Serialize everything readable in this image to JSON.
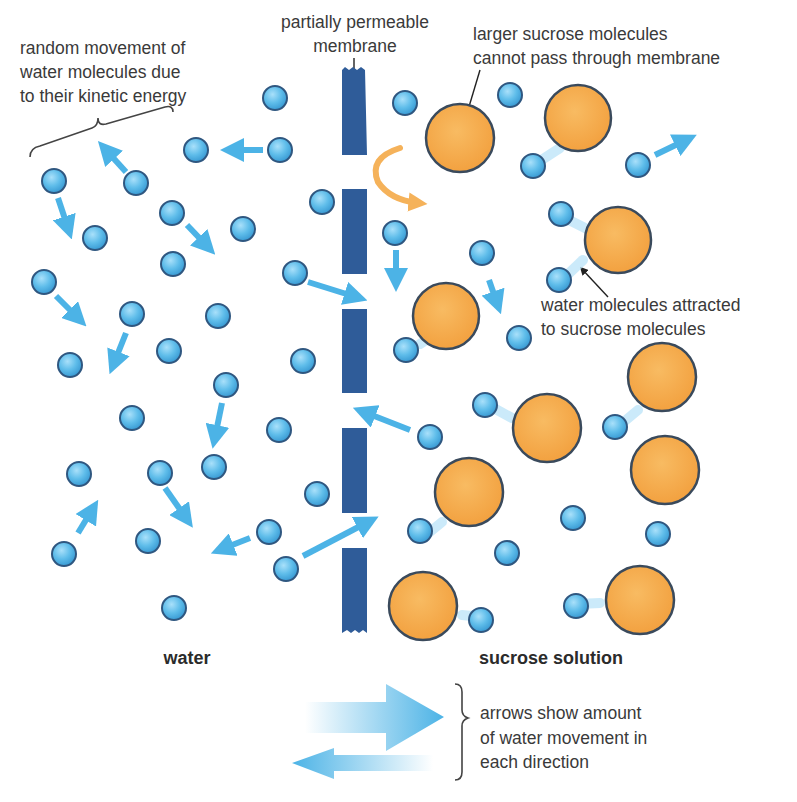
{
  "diagram": {
    "colors": {
      "water_molecule": "#5fbdea",
      "water_outline": "#2f5780",
      "sucrose_molecule": "#f5a94a",
      "sucrose_outline": "#3a4a5c",
      "membrane": "#2f5c99",
      "movement_arrow": "#4cb3e6",
      "blocked_arrow": "#f5b25a",
      "text": "#3a3a3a"
    },
    "labels": {
      "random_movement": [
        "random movement of",
        "water molecules due",
        "to their kinetic energy"
      ],
      "membrane": [
        "partially permeable",
        "membrane"
      ],
      "sucrose_blocked": [
        "larger sucrose molecules",
        "cannot pass through membrane"
      ],
      "water_attracted": [
        "water molecules attracted",
        "to sucrose molecules"
      ],
      "left_region": "water",
      "right_region": "sucrose solution",
      "legend": [
        "arrows show amount",
        "of water movement in",
        "each direction"
      ]
    },
    "regions": [
      {
        "name": "water",
        "side": "left"
      },
      {
        "name": "sucrose solution",
        "side": "right"
      }
    ],
    "legend_arrows": [
      {
        "direction": "right",
        "size": "large",
        "meaning": "more water movement into sucrose solution"
      },
      {
        "direction": "left",
        "size": "small",
        "meaning": "less water movement into water side"
      }
    ]
  }
}
